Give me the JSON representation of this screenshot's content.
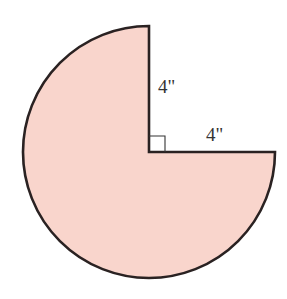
{
  "figure": {
    "shape": "three-quarter-circle",
    "fill_color": "#F9D5CC",
    "stroke_color": "#2a2222",
    "center": [
      149,
      152
    ],
    "radius_px": 126,
    "labels": {
      "vertical_radius": "4\"",
      "horizontal_radius": "4\""
    },
    "right_angle_marker": true
  }
}
